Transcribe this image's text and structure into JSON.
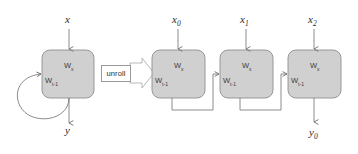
{
  "diagram": {
    "colors": {
      "cell_fill": "#d0d0d0",
      "cell_stroke": "#8f8f8f",
      "connector": "#6e6e6e",
      "text": "#2b2b2b",
      "arrow_fill": "#ffffff",
      "arrow_stroke": "#b0b0b0",
      "background": "#ffffff"
    },
    "transition": {
      "label": "unroll",
      "icon": "block-arrow-right-icon"
    },
    "folded": {
      "input_label": "x",
      "output_label": "y",
      "cell": {
        "input_weight": "W",
        "input_weight_sub": "x",
        "recurrent_weight": "W",
        "recurrent_weight_sub": "t-1"
      },
      "self_loop": "recurrent-loop"
    },
    "unrolled": {
      "cells": [
        {
          "input_label": "x",
          "input_sub": "0",
          "input_weight": "W",
          "input_weight_sub": "x",
          "recurrent_weight": "W",
          "recurrent_weight_sub": "t-1",
          "output_label": "",
          "output_sub": ""
        },
        {
          "input_label": "x",
          "input_sub": "1",
          "input_weight": "W",
          "input_weight_sub": "x",
          "recurrent_weight": "W",
          "recurrent_weight_sub": "t-1",
          "output_label": "",
          "output_sub": ""
        },
        {
          "input_label": "x",
          "input_sub": "2",
          "input_weight": "W",
          "input_weight_sub": "x",
          "recurrent_weight": "W",
          "recurrent_weight_sub": "t-1",
          "output_label": "y",
          "output_sub": "0"
        }
      ]
    }
  }
}
